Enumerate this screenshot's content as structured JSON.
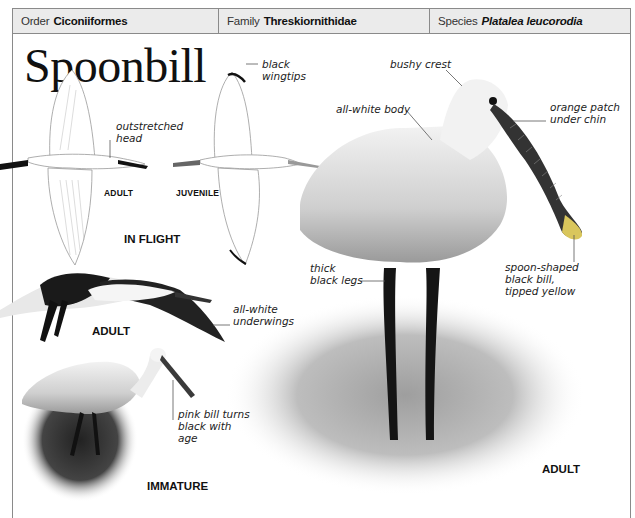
{
  "header": {
    "order": {
      "label": "Order",
      "value": "Ciconiiformes"
    },
    "family": {
      "label": "Family",
      "value": "Threskiornithidae"
    },
    "species": {
      "label": "Species",
      "value": "Platalea leucorodia"
    }
  },
  "title": "Spoonbill",
  "flight_section": {
    "section_label": "IN FLIGHT",
    "adult_label": "ADULT",
    "juvenile_label": "JUVENILE",
    "captions": {
      "outstretched_head": "outstretched\nhead",
      "black_wingtips": "black\nwingtips"
    }
  },
  "flying_adult": {
    "label": "ADULT",
    "caption": "all-white\nunderwings"
  },
  "immature": {
    "label": "IMMATURE",
    "caption": "pink bill turns\nblack with\nage"
  },
  "standing_adult": {
    "label": "ADULT",
    "captions": {
      "bushy_crest": "bushy crest",
      "all_white_body": "all-white body",
      "orange_patch": "orange patch\nunder chin",
      "thick_legs": "thick\nblack legs",
      "spoon_bill": "spoon-shaped\nblack bill,\ntipped yellow"
    }
  },
  "colors": {
    "header_bg": "#ebebeb",
    "border": "#8a8a8a",
    "text": "#222222"
  }
}
